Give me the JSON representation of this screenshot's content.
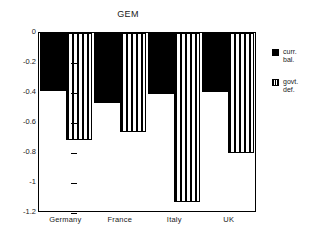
{
  "chart_data": {
    "type": "bar",
    "title": "GEM",
    "xlabel": "",
    "ylabel": "",
    "categories": [
      "Germany",
      "France",
      "Italy",
      "UK"
    ],
    "series": [
      {
        "name": "curr. bal.",
        "style": "solid",
        "values": [
          -0.39,
          -0.475,
          -0.41,
          -0.395
        ]
      },
      {
        "name": "govt. def.",
        "style": "striped",
        "values": [
          -0.72,
          -0.67,
          -1.14,
          -0.81
        ]
      }
    ],
    "ylim": [
      -1.2,
      0
    ],
    "yticks": [
      0,
      -0.2,
      -0.4,
      -0.6,
      -0.8,
      -1,
      -1.2
    ],
    "ytick_labels": [
      "0",
      "-0.2",
      "-0.4",
      "-0.6",
      "-0.8",
      "-1",
      "-1.2"
    ],
    "grid": false,
    "legend_position": "right",
    "legend": [
      {
        "label_line1": "curr.",
        "label_line2": "bal.",
        "swatch": "solid-square-icon"
      },
      {
        "label_line1": "govt.",
        "label_line2": "def.",
        "swatch": "striped-square-icon"
      }
    ],
    "colors": {
      "series1": "#000000",
      "series2": "#ffffff",
      "axis": "#000000",
      "background": "#ffffff"
    }
  }
}
